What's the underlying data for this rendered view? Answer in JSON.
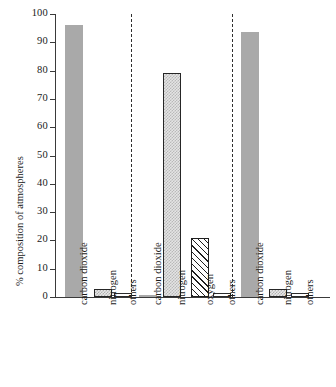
{
  "chart_data": {
    "type": "bar",
    "title": "",
    "xlabel": "",
    "ylabel": "% composition of atmospheres",
    "ylim": [
      0,
      100
    ],
    "yticks": [
      0,
      10,
      20,
      30,
      40,
      50,
      60,
      70,
      80,
      90,
      100
    ],
    "ytick_labels": [
      "0",
      "10",
      "20",
      "30",
      "40",
      "50",
      "60",
      "70",
      "80",
      "90",
      "100"
    ],
    "grid": false,
    "legend": "none",
    "groups_separated_by_dashed_lines": true,
    "categories": [
      "carbon dioxide",
      "nitrogen",
      "others",
      "carbon dioxide",
      "nitrogen",
      "oxygen",
      "others",
      "carbon dioxide",
      "nitrogen",
      "others"
    ],
    "values": [
      96,
      3,
      1.5,
      0.8,
      79,
      21,
      1.5,
      93.5,
      3,
      1.5
    ],
    "bars": [
      {
        "label": "carbon dioxide",
        "value": 96,
        "style": "solid",
        "group": 1
      },
      {
        "label": "nitrogen",
        "value": 3,
        "style": "dotted-small",
        "group": 1
      },
      {
        "label": "others",
        "value": 1.5,
        "style": "outline",
        "group": 1
      },
      {
        "label": "carbon dioxide",
        "value": 0.8,
        "style": "solid",
        "group": 2
      },
      {
        "label": "nitrogen",
        "value": 79,
        "style": "dotted",
        "group": 2
      },
      {
        "label": "oxygen",
        "value": 21,
        "style": "hatch",
        "group": 2
      },
      {
        "label": "others",
        "value": 1.5,
        "style": "outline",
        "group": 2
      },
      {
        "label": "carbon dioxide",
        "value": 93.5,
        "style": "solid",
        "group": 3
      },
      {
        "label": "nitrogen",
        "value": 3,
        "style": "dotted-small",
        "group": 3
      },
      {
        "label": "others",
        "value": 1.5,
        "style": "outline",
        "group": 3
      }
    ],
    "colors": {
      "solid_fill": "#a9a9a9",
      "outline_stroke": "#2b2b2b",
      "hatch_stroke": "#1f1f1f",
      "axis": "#3a3a3a",
      "background": "#ffffff",
      "text": "#1a1a1a"
    }
  }
}
